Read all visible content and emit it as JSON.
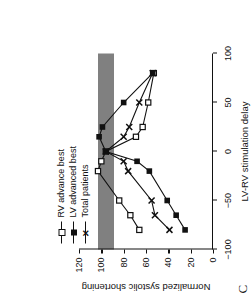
{
  "panel": {
    "letter": "C"
  },
  "legend": {
    "items": [
      {
        "label": "RV advance best",
        "marker": "open-square",
        "line": "dashed-open"
      },
      {
        "label": "LV advanced best",
        "marker": "filled-square",
        "line": "solid"
      },
      {
        "label": "Total patients",
        "marker": "cross",
        "line": "dashed-cross"
      }
    ]
  },
  "chart_data": {
    "type": "line",
    "title": "",
    "xlabel": "LV-RV stimulation delay",
    "ylabel": "Normalized systolic shortening",
    "xlim": [
      -100,
      100
    ],
    "ylim": [
      0,
      120
    ],
    "xticks": [
      -100,
      -50,
      0,
      50,
      100
    ],
    "yticks": [
      0,
      20,
      40,
      60,
      80,
      100,
      120
    ],
    "grid": false,
    "legend_position": "top-left",
    "x": [
      -80,
      -65,
      -50,
      -20,
      -10,
      0,
      15,
      25,
      50,
      80
    ],
    "series": [
      {
        "name": "RV advance best",
        "marker": "open-square",
        "values": [
          66,
          74,
          84,
          103,
          100,
          96,
          69,
          63,
          58,
          53
        ]
      },
      {
        "name": "LV advanced best",
        "marker": "filled-square",
        "values": [
          25,
          33,
          41,
          57,
          68,
          96,
          102,
          99,
          80,
          54
        ]
      },
      {
        "name": "Total patients",
        "marker": "cross",
        "values": [
          39,
          52,
          55,
          76,
          80,
          96,
          80,
          75,
          66,
          54
        ]
      }
    ],
    "annotations": [
      {
        "type": "band",
        "name": "normal-range-band",
        "orientation": "horizontal",
        "y_range": [
          89,
          103
        ],
        "color": "#808080",
        "label": ""
      }
    ]
  }
}
